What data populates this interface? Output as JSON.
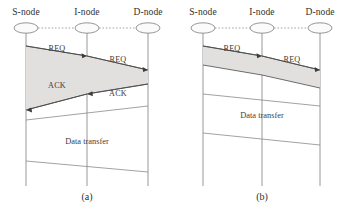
{
  "figure": {
    "node_labels": [
      "S-node",
      "I-node",
      "D-node"
    ],
    "colors": {
      "shade_fill": "#e2e0df",
      "line": "#5e5e5e",
      "lifeline": "#8d8d8d",
      "arrow": "#3d3d3d",
      "text": "#2f2f2f",
      "background": "#ffffff"
    }
  },
  "panels": [
    {
      "caption": "(a)",
      "nodes": [
        {
          "label": "S-node",
          "x": 26
        },
        {
          "label": "I-node",
          "x": 87
        },
        {
          "label": "D-node",
          "x": 148
        }
      ],
      "messages": [
        {
          "label": "REQ",
          "from": "S-node",
          "to": "I-node",
          "direction": "right",
          "label_x": 57,
          "label_y": 51
        },
        {
          "label": "REQ",
          "from": "I-node",
          "to": "D-node",
          "direction": "right",
          "label_x": 118,
          "label_y": 62
        },
        {
          "label": "ACK",
          "from": "I-node",
          "to": "S-node",
          "direction": "left",
          "label_x": 57,
          "label_y": 88
        },
        {
          "label": "ACK",
          "from": "D-node",
          "to": "I-node",
          "direction": "left",
          "label_x": 118,
          "label_y": 96
        }
      ],
      "phases": [
        {
          "label": "Data transfer",
          "label_x": 87,
          "label_y": 144
        }
      ]
    },
    {
      "caption": "(b)",
      "nodes": [
        {
          "label": "S-node",
          "x": 203
        },
        {
          "label": "I-node",
          "x": 262
        },
        {
          "label": "D-node",
          "x": 320
        }
      ],
      "messages": [
        {
          "label": "REQ",
          "from": "S-node",
          "to": "I-node",
          "direction": "right",
          "label_x": 232,
          "label_y": 51
        },
        {
          "label": "REQ",
          "from": "I-node",
          "to": "D-node",
          "direction": "right",
          "label_x": 292,
          "label_y": 62
        }
      ],
      "phases": [
        {
          "label": "Data transfer",
          "label_x": 262,
          "label_y": 118
        }
      ]
    }
  ]
}
